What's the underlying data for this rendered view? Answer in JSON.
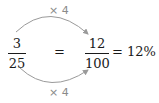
{
  "diagram": {
    "left_fraction": {
      "numerator": "3",
      "denominator": "25"
    },
    "equals_sign": "=",
    "right_fraction": {
      "numerator": "12",
      "denominator": "100"
    },
    "result": "= 12%",
    "top_multiplier": "× 4",
    "bottom_multiplier": "× 4",
    "colors": {
      "text": "#1a1a1a",
      "arrow": "#9a9a9a",
      "label": "#8a8a8a"
    }
  }
}
